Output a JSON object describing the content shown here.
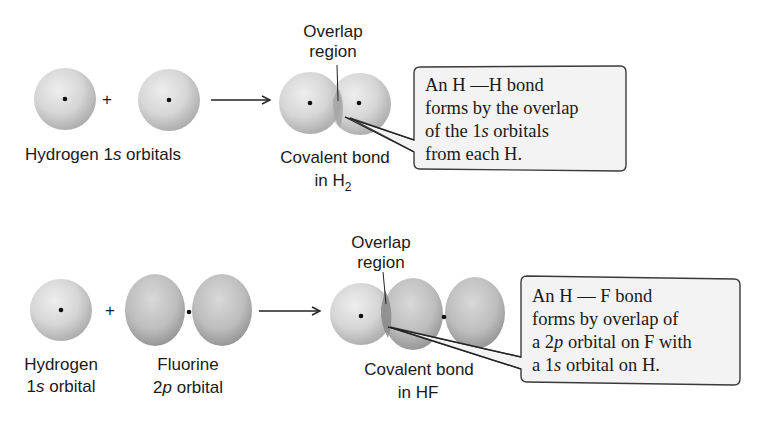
{
  "diagram": {
    "type": "orbital-overlap",
    "panels": [
      {
        "id": "h2",
        "reactant_labels": [
          "Hydrogen 1s orbitals"
        ],
        "reactant_label_parts": {
          "pre": "Hydrogen 1",
          "italic": "s",
          "post": " orbitals"
        },
        "operator": "+",
        "arrow": "→",
        "overlap_label": [
          "Overlap",
          "region"
        ],
        "product_label": [
          "Covalent bond",
          "in H",
          "2"
        ],
        "callout": {
          "lines": [
            "An H —H bond",
            "forms by the overlap",
            "of the 1s orbitals",
            "from each H."
          ],
          "line3_parts": {
            "pre": "of the 1",
            "italic": "s",
            "post": " orbitals"
          }
        }
      },
      {
        "id": "hf",
        "reactant1_label": {
          "line1": "Hydrogen",
          "line2_pre": "1",
          "line2_italic": "s",
          "line2_post": " orbital"
        },
        "reactant2_label": {
          "line1": "Fluorine",
          "line2_pre": "2",
          "line2_italic": "p",
          "line2_post": " orbital"
        },
        "operator": "+",
        "arrow": "→",
        "overlap_label": [
          "Overlap",
          "region"
        ],
        "product_label": [
          "Covalent bond",
          "in HF"
        ],
        "callout": {
          "lines": [
            "An H—F bond",
            "forms by overlap of",
            "a 2p orbital on F with",
            "a 1s orbital on H."
          ],
          "line1": "An H — F bond",
          "line2": "forms by overlap of",
          "line3_parts": {
            "pre": "a 2",
            "italic": "p",
            "post": " orbital on F with"
          },
          "line4_parts": {
            "pre": "a 1",
            "italic": "s",
            "post": " orbital on H."
          }
        }
      }
    ],
    "colors": {
      "sphere_light": "#e6e6e6",
      "sphere_dark": "#9a9a9a",
      "overlap": "#8c8c8c",
      "callout_fill": "#f3f3f3",
      "line": "#1a1a1a"
    }
  }
}
